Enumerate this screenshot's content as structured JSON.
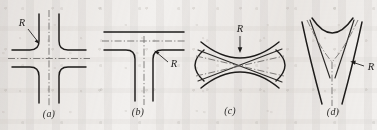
{
  "figure": {
    "background_color": "#f2f0ee",
    "ink_color": "#1d1b1a",
    "centerline_color": "#6f6d6a",
    "width": 377,
    "height": 130
  },
  "panels": [
    {
      "id": "panel-a",
      "caption": "(a)",
      "junction_type": "four-way-crossing",
      "dimension_label": "R",
      "dimension_meaning": "fillet-radius",
      "leader_direction": "down-right"
    },
    {
      "id": "panel-b",
      "caption": "(b)",
      "junction_type": "tee-junction",
      "dimension_label": "R",
      "dimension_meaning": "fillet-radius",
      "leader_direction": "up-left"
    },
    {
      "id": "panel-c",
      "caption": "(c)",
      "junction_type": "oblique-crossing",
      "dimension_label": "R",
      "dimension_meaning": "fillet-radius",
      "leader_direction": "down"
    },
    {
      "id": "panel-d",
      "caption": "(d)",
      "junction_type": "wye-junction",
      "dimension_label": "R",
      "dimension_meaning": "fillet-radius",
      "leader_direction": "left"
    }
  ]
}
